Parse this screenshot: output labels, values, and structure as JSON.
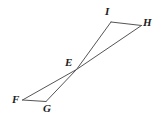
{
  "figure": {
    "type": "geometry-diagram",
    "background_color": "#ffffff",
    "stroke_color": "#555555",
    "label_color": "#1c1c1c",
    "stroke_width": 1,
    "canvas": {
      "width": 161,
      "height": 120
    },
    "points": {
      "E": {
        "label": "E",
        "x": 76.5,
        "y": 69.5,
        "label_x": 65,
        "label_y": 57
      },
      "F": {
        "label": "F",
        "x": 22.5,
        "y": 100.0,
        "label_x": 12,
        "label_y": 94
      },
      "G": {
        "label": "G",
        "x": 46.0,
        "y": 101.5,
        "label_x": 43,
        "label_y": 103
      },
      "H": {
        "label": "H",
        "x": 141.5,
        "y": 25.5,
        "label_x": 143,
        "label_y": 17
      },
      "I": {
        "label": "I",
        "x": 111.0,
        "y": 22.0,
        "label_x": 105,
        "label_y": 6
      }
    },
    "segments": [
      {
        "name": "segment-I-H",
        "from": "I",
        "to": "H"
      },
      {
        "name": "segment-I-E",
        "from": "I",
        "to": "E"
      },
      {
        "name": "segment-H-E",
        "from": "H",
        "to": "E"
      },
      {
        "name": "segment-E-F",
        "from": "E",
        "to": "F"
      },
      {
        "name": "segment-E-G",
        "from": "E",
        "to": "G"
      },
      {
        "name": "segment-F-G",
        "from": "F",
        "to": "G"
      }
    ]
  }
}
